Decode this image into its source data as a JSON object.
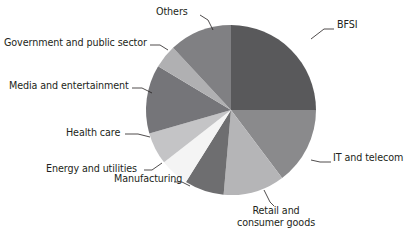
{
  "chart_data": {
    "type": "pie",
    "title": "",
    "subtitle": "",
    "xlabel": "",
    "ylabel": "",
    "legend_position": "none",
    "grid": false,
    "label_style": "outside-with-leader-lines",
    "start_angle_deg": 0,
    "direction": "clockwise",
    "center": {
      "x": 231,
      "y": 110
    },
    "radius": 85,
    "categories": [
      "BFSI",
      "IT and telecom",
      "Retail and consumer goods",
      "Manufacturing",
      "Energy and utilities",
      "Health care",
      "Media and entertainment",
      "Government and public sector",
      "Others"
    ],
    "values": [
      25.0,
      14.7,
      11.7,
      7.5,
      5.6,
      6.1,
      13.1,
      4.4,
      11.9
    ],
    "units": "percent",
    "slices": [
      {
        "label": "BFSI",
        "value": 25.0,
        "color": "#59595b",
        "start_deg": 0,
        "end_deg": 90
      },
      {
        "label": "IT and telecom",
        "value": 14.7,
        "color": "#8a8a8c",
        "start_deg": 90,
        "end_deg": 143
      },
      {
        "label": "Retail and consumer goods",
        "value": 11.7,
        "color": "#b5b5b7",
        "start_deg": 143,
        "end_deg": 185
      },
      {
        "label": "Manufacturing",
        "value": 7.5,
        "color": "#6e6e70",
        "start_deg": 185,
        "end_deg": 212
      },
      {
        "label": "Energy and utilities",
        "value": 5.6,
        "color": "#f4f4f4",
        "start_deg": 212,
        "end_deg": 232
      },
      {
        "label": "Health care",
        "value": 6.1,
        "color": "#c4c4c6",
        "start_deg": 232,
        "end_deg": 254
      },
      {
        "label": "Media and entertainment",
        "value": 13.1,
        "color": "#757579",
        "start_deg": 254,
        "end_deg": 301
      },
      {
        "label": "Government and public sector",
        "value": 4.4,
        "color": "#b0b0b2",
        "start_deg": 301,
        "end_deg": 317
      },
      {
        "label": "Others",
        "value": 11.9,
        "color": "#808083",
        "start_deg": 317,
        "end_deg": 360
      }
    ]
  },
  "labels": {
    "bfsi": "BFSI",
    "it_and_telecom": "IT and telecom",
    "retail_and_consumer_goods": "Retail and\nconsumer goods",
    "retail_line1": "Retail and",
    "retail_line2": "consumer goods",
    "manufacturing": "Manufacturing",
    "energy_and_utilities": "Energy and utilities",
    "health_care": "Health care",
    "media_and_entertainment": "Media and entertainment",
    "government_and_public_sector": "Government and public sector",
    "others": "Others"
  },
  "colors": {
    "background": "#ffffff",
    "text": "#231f20",
    "leader_line": "#231f20"
  }
}
